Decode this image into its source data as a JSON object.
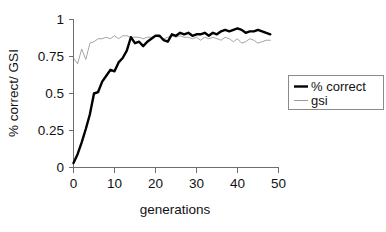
{
  "chart_data": {
    "type": "line",
    "title": "",
    "xlabel": "generations",
    "ylabel": "% correct/ GSI",
    "xlim": [
      0,
      50
    ],
    "ylim": [
      0,
      1
    ],
    "grid": false,
    "legend_position": "right",
    "xticks": [
      "0",
      "10",
      "20",
      "30",
      "40",
      "50"
    ],
    "xtick_values": [
      0,
      10,
      20,
      30,
      40,
      50
    ],
    "yticks": [
      "0",
      "0.25",
      "0.5",
      "0.75",
      "1"
    ],
    "ytick_values": [
      0,
      0.25,
      0.5,
      0.75,
      1
    ],
    "x": [
      0,
      1,
      2,
      3,
      4,
      5,
      6,
      7,
      8,
      9,
      10,
      11,
      12,
      13,
      14,
      15,
      16,
      17,
      18,
      19,
      20,
      21,
      22,
      23,
      24,
      25,
      26,
      27,
      28,
      29,
      30,
      31,
      32,
      33,
      34,
      35,
      36,
      37,
      38,
      39,
      40,
      41,
      42,
      43,
      44,
      45,
      46,
      47,
      48
    ],
    "series": [
      {
        "name": "% correct",
        "color": "#000000",
        "line_width": 2.4,
        "values": [
          0.03,
          0.09,
          0.17,
          0.26,
          0.36,
          0.5,
          0.51,
          0.58,
          0.62,
          0.66,
          0.65,
          0.71,
          0.74,
          0.79,
          0.88,
          0.84,
          0.85,
          0.82,
          0.85,
          0.87,
          0.89,
          0.89,
          0.86,
          0.85,
          0.9,
          0.89,
          0.91,
          0.9,
          0.91,
          0.89,
          0.9,
          0.9,
          0.91,
          0.89,
          0.91,
          0.9,
          0.92,
          0.93,
          0.92,
          0.93,
          0.94,
          0.93,
          0.91,
          0.92,
          0.92,
          0.93,
          0.92,
          0.91,
          0.9
        ]
      },
      {
        "name": "gsi",
        "color": "#9a9a9a",
        "line_width": 0.9,
        "values": [
          0.74,
          0.7,
          0.8,
          0.73,
          0.84,
          0.85,
          0.87,
          0.87,
          0.88,
          0.87,
          0.89,
          0.87,
          0.89,
          0.89,
          0.88,
          0.88,
          0.88,
          0.87,
          0.88,
          0.88,
          0.89,
          0.88,
          0.87,
          0.88,
          0.89,
          0.88,
          0.89,
          0.88,
          0.88,
          0.87,
          0.88,
          0.86,
          0.88,
          0.87,
          0.88,
          0.87,
          0.86,
          0.88,
          0.87,
          0.85,
          0.87,
          0.84,
          0.85,
          0.87,
          0.86,
          0.84,
          0.85,
          0.86,
          0.86
        ]
      }
    ]
  },
  "legend": {
    "entries": [
      {
        "label": "% correct",
        "swatch": "thick-black-line"
      },
      {
        "label": "gsi",
        "swatch": "thin-gray-line"
      }
    ]
  },
  "colors": {
    "background": "#ffffff",
    "axis": "#6e6e6e",
    "text": "#121212",
    "series_correct": "#000000",
    "series_gsi": "#9a9a9a",
    "legend_border": "#8a8a8a"
  }
}
